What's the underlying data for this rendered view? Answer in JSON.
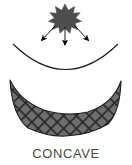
{
  "figure": {
    "caption": "CONCAVE",
    "title": "CONCAVE",
    "background_color": "#ffffff",
    "line_color": "#1a1a1a",
    "caption_color": "#4a4a4a",
    "source_fill": "#4d4d4d",
    "arrow_color": "#000000",
    "surface_fill": "#6b6b6b",
    "surface_hatch_color": "#2b2b2b",
    "surface_outline_color": "#1f1f1f"
  },
  "elements": {
    "source": {
      "name": "radiation-source-star",
      "label": "",
      "center_x": 65,
      "center_y": 16,
      "outer_radius": 12,
      "inner_radius": 6,
      "points": 9
    },
    "rays": [
      {
        "name": "ray-left",
        "label": "",
        "x1": 57,
        "y1": 26,
        "x2": 42,
        "y2": 42,
        "direction": "down-left"
      },
      {
        "name": "ray-center",
        "label": "",
        "x1": 65,
        "y1": 28,
        "x2": 65,
        "y2": 46,
        "direction": "down"
      },
      {
        "name": "ray-right",
        "label": "",
        "x1": 74,
        "y1": 26,
        "x2": 89,
        "y2": 42,
        "direction": "down-right"
      }
    ],
    "arc": {
      "name": "concave-arc",
      "label": "",
      "start_x": 13,
      "start_y": 44,
      "end_x": 118,
      "end_y": 44,
      "sagitta_y": 73,
      "opens": "upward"
    },
    "surface": {
      "name": "concave-surface-body",
      "label": "",
      "left_x": 9,
      "right_x": 121,
      "top_y": 80,
      "bottom_y": 136,
      "dip_y": 104,
      "fill_pattern": "crosshatch-diagonal"
    }
  }
}
